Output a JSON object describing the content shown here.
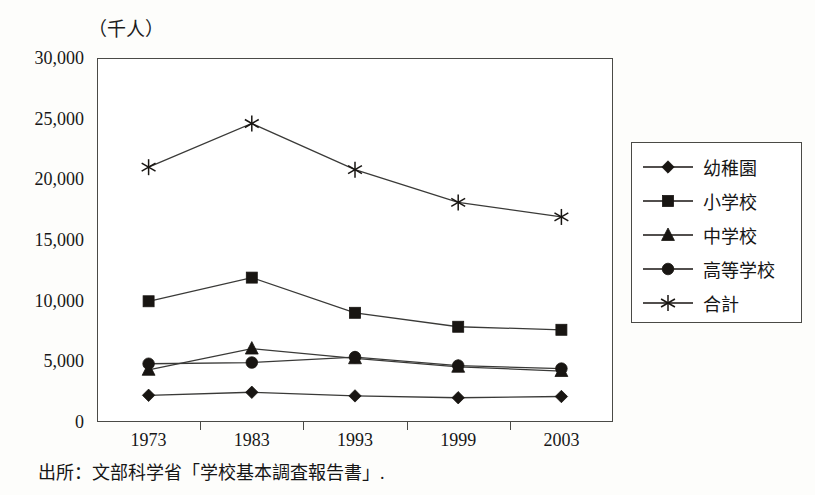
{
  "figure": {
    "unit_label": "（千人）",
    "source_note": "出所：文部科学省「学校基本調査報告書」."
  },
  "chart_data": {
    "type": "line",
    "title": "",
    "subtitle": "",
    "xlabel": "",
    "ylabel": "（千人）",
    "categories": [
      "1973",
      "1983",
      "1993",
      "1999",
      "2003"
    ],
    "x": [
      1973,
      1983,
      1993,
      1999,
      2003
    ],
    "ylim": [
      0,
      30000
    ],
    "xlim_categorical": true,
    "grid": false,
    "legend_position": "right",
    "y_ticks": [
      0,
      5000,
      10000,
      15000,
      20000,
      25000,
      30000
    ],
    "y_tick_labels": [
      "0",
      "5,000",
      "10,000",
      "15,000",
      "20,000",
      "25,000",
      "30,000"
    ],
    "series": [
      {
        "name": "幼稚園",
        "marker": "diamond",
        "color": "#181512",
        "values": [
          2200,
          2450,
          2150,
          2000,
          2100
        ]
      },
      {
        "name": "小学校",
        "marker": "square",
        "color": "#181512",
        "values": [
          9950,
          11900,
          9000,
          7850,
          7600
        ]
      },
      {
        "name": "中学校",
        "marker": "triangle",
        "color": "#181512",
        "values": [
          4300,
          6050,
          5250,
          4550,
          4200
        ]
      },
      {
        "name": "高等学校",
        "marker": "circle",
        "color": "#181512",
        "values": [
          4800,
          4900,
          5350,
          4650,
          4400
        ]
      },
      {
        "name": "合計",
        "marker": "star",
        "color": "#181512",
        "values": [
          21000,
          24600,
          20800,
          18100,
          16900
        ]
      }
    ]
  }
}
